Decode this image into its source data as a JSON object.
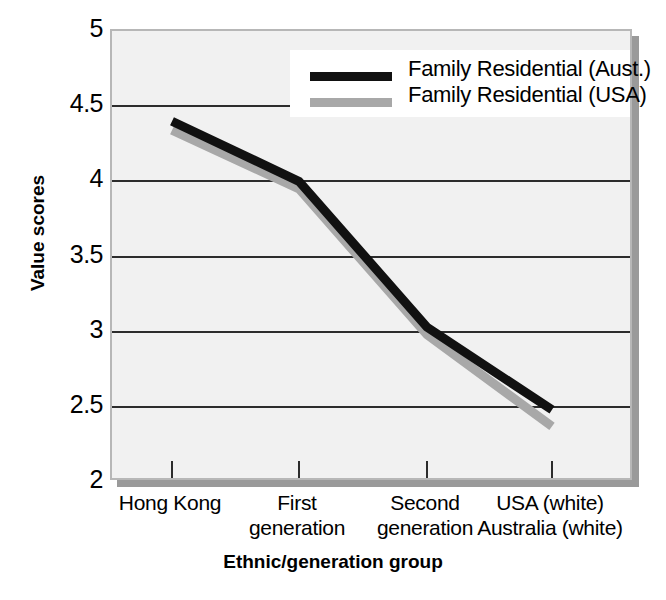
{
  "chart_data": {
    "type": "line",
    "title": "",
    "xlabel": "Ethnic/generation group",
    "ylabel": "Value scores",
    "categories": [
      "Hong Kong",
      "First generation",
      "Second generation",
      "USA (white) Australia (white)"
    ],
    "category_lines": [
      [
        "Hong Kong"
      ],
      [
        "First",
        "generation"
      ],
      [
        "Second",
        "generation"
      ],
      [
        "USA (white)",
        "Australia (white)"
      ]
    ],
    "series": [
      {
        "name": "Family Residential (Aust.)",
        "color": "#111111",
        "values": [
          4.4,
          4.0,
          3.03,
          2.48
        ]
      },
      {
        "name": "Family Residential (USA)",
        "color": "#a8a8a8",
        "values": [
          4.34,
          3.95,
          2.98,
          2.37
        ]
      }
    ],
    "ylim": [
      2,
      5
    ],
    "yticks": [
      5,
      4.5,
      4,
      3.5,
      3,
      2.5,
      2
    ],
    "ytick_labels": [
      "5",
      "4.5",
      "4",
      "3.5",
      "3",
      "2.5",
      "2"
    ],
    "gridlines": [
      4.5,
      4,
      3.5,
      3,
      2.5
    ],
    "grid": true,
    "legend_position": "top-right",
    "plot_background": "#f1f1f1",
    "grid_color": "#2c2c2c"
  }
}
